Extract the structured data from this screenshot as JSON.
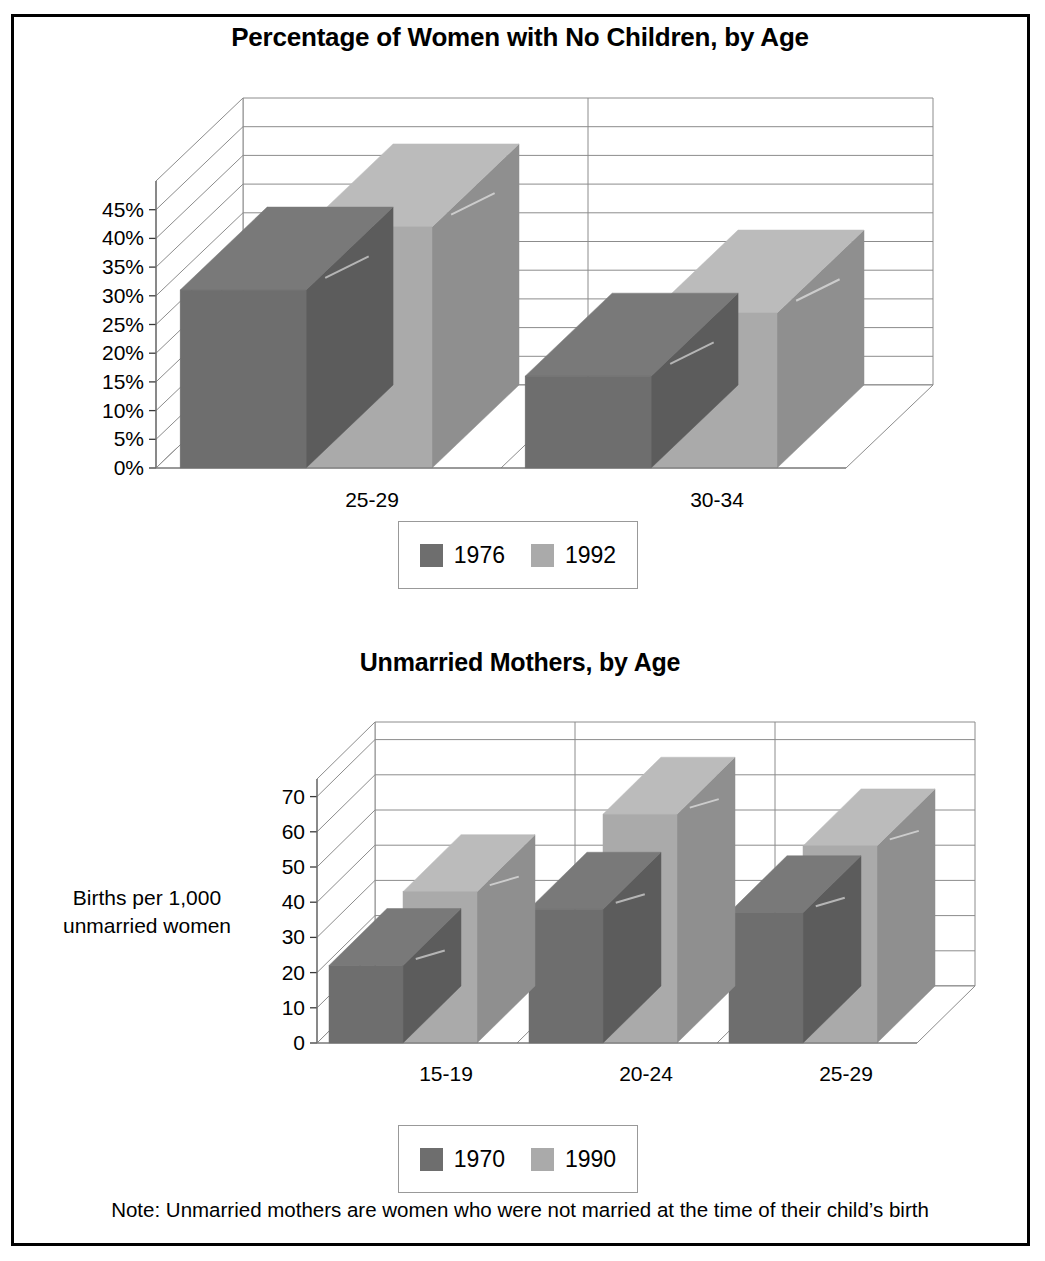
{
  "figure": {
    "note": "Note: Unmarried mothers are women who were not married at the time of their child’s birth",
    "border_color": "#000000",
    "series_colors": {
      "dark": "#6e6e6e",
      "light": "#aaaaaa"
    }
  },
  "chart_data": [
    {
      "type": "bar",
      "title": "Percentage of Women with No Children, by Age",
      "xlabel": "",
      "ylabel": "",
      "categories": [
        "25-29",
        "30-34"
      ],
      "series": [
        {
          "name": "1976",
          "color": "#6e6e6e",
          "values": [
            31,
            16
          ]
        },
        {
          "name": "1992",
          "color": "#aaaaaa",
          "values": [
            42,
            27
          ]
        }
      ],
      "ylim": [
        0,
        50
      ],
      "yticks": [
        0,
        5,
        10,
        15,
        20,
        25,
        30,
        35,
        40,
        45
      ],
      "ytick_labels": [
        "0%",
        "5%",
        "10%",
        "15%",
        "20%",
        "25%",
        "30%",
        "35%",
        "40%",
        "45%"
      ],
      "grid": true,
      "legend_position": "bottom",
      "legend_entries": [
        "1976",
        "1992"
      ],
      "three_d": true
    },
    {
      "type": "bar",
      "title": "Unmarried Mothers, by Age",
      "xlabel": "",
      "ylabel": "Births per 1,000 unmarried women",
      "ylabel_lines": [
        "Births per 1,000",
        "unmarried women"
      ],
      "categories": [
        "15-19",
        "20-24",
        "25-29"
      ],
      "series": [
        {
          "name": "1970",
          "color": "#6e6e6e",
          "values": [
            22,
            38,
            37
          ]
        },
        {
          "name": "1990",
          "color": "#aaaaaa",
          "values": [
            43,
            65,
            56
          ]
        }
      ],
      "ylim": [
        0,
        75
      ],
      "yticks": [
        0,
        10,
        20,
        30,
        40,
        50,
        60,
        70
      ],
      "ytick_labels": [
        "0",
        "10",
        "20",
        "30",
        "40",
        "50",
        "60",
        "70"
      ],
      "grid": true,
      "legend_position": "bottom",
      "legend_entries": [
        "1970",
        "1990"
      ],
      "three_d": true
    }
  ]
}
